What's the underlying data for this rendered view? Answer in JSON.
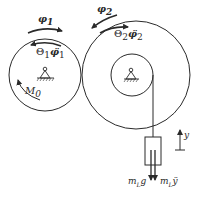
{
  "diagram": {
    "type": "mechanical gear/pulley system",
    "wheel1": {
      "angle_label": "φ₁",
      "inertia_label": "Θ₁φ̈₁",
      "moment_label": "M₀"
    },
    "wheel2": {
      "angle_label": "φ₂",
      "inertia_label": "Θ₂φ̈₂"
    },
    "load": {
      "weight_label": "m_L g",
      "inertia_force_label": "m_L ÿ"
    },
    "axis": {
      "y_label": "y"
    }
  },
  "labels": {
    "phi1": "φ",
    "phi1_sub": "1",
    "theta1": "Θ",
    "theta1_sub": "1",
    "phi1dd": "φ̈",
    "phi1dd_sub": "1",
    "m0": "M",
    "m0_sub": "0",
    "phi2": "φ",
    "phi2_sub": "2",
    "theta2": "Θ",
    "theta2_sub": "2",
    "phi2dd": "φ̈",
    "phi2dd_sub": "2",
    "mlg_m": "m",
    "mlg_sub": "L",
    "mlg_g": "g",
    "mly_m": "m",
    "mly_sub": "L",
    "mly_y": "ÿ",
    "y": "y"
  },
  "colors": {
    "stroke": "#2a2a2a",
    "background": "#ffffff"
  }
}
